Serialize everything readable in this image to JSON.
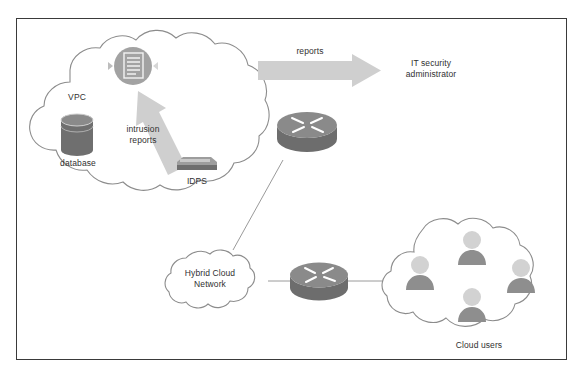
{
  "figure": {
    "caption": "",
    "frame_color": "#3a3a3a",
    "background": "#ffffff"
  },
  "palette": {
    "cloud_outline": "#8c8c8c",
    "device_gray": "#7f7f7f",
    "device_gray_dark": "#6b6b6b",
    "arrow_gray": "#c3c3c3",
    "line_gray": "#9a9a9a",
    "user_body": "#8e8e8e",
    "user_head": "#d2d2d2",
    "text": "#303030"
  },
  "labels": {
    "vpc": "VPC",
    "database": "database",
    "intrusion_reports": "intrusion\nreports",
    "idps": "IDPS",
    "reports": "reports",
    "it_security_admin": "IT security\nadministrator",
    "hybrid_cloud_network": "Hybrid Cloud\nNetwork",
    "cloud_users": "Cloud users"
  },
  "nodes": [
    {
      "id": "vpc-cloud",
      "type": "cloud",
      "label": "VPC"
    },
    {
      "id": "database",
      "type": "cylinder",
      "label": "database"
    },
    {
      "id": "report-badge",
      "type": "document-circle",
      "label": ""
    },
    {
      "id": "idps",
      "type": "appliance",
      "label": "IDPS"
    },
    {
      "id": "router-top",
      "type": "router",
      "label": ""
    },
    {
      "id": "router-bottom",
      "type": "router",
      "label": ""
    },
    {
      "id": "hybrid-cloud",
      "type": "cloud",
      "label": "Hybrid Cloud Network"
    },
    {
      "id": "users-cloud",
      "type": "cloud",
      "label": "Cloud users"
    },
    {
      "id": "user-1",
      "type": "user",
      "label": ""
    },
    {
      "id": "user-2",
      "type": "user",
      "label": ""
    },
    {
      "id": "user-3",
      "type": "user",
      "label": ""
    },
    {
      "id": "user-4",
      "type": "user",
      "label": ""
    }
  ],
  "edges": [
    {
      "id": "idps-to-report",
      "from": "idps",
      "to": "report-badge",
      "style": "block-arrow",
      "label": "intrusion\nreports"
    },
    {
      "id": "vpc-to-admin",
      "from": "router-top",
      "to": "it-security-admin",
      "style": "block-arrow",
      "label": "reports"
    },
    {
      "id": "routertop-to-hybrid",
      "from": "router-top",
      "to": "hybrid-cloud",
      "style": "line",
      "label": ""
    },
    {
      "id": "hybrid-to-routerbottom",
      "from": "hybrid-cloud",
      "to": "router-bottom",
      "style": "line",
      "label": ""
    },
    {
      "id": "routerbottom-to-users",
      "from": "router-bottom",
      "to": "users-cloud",
      "style": "line",
      "label": ""
    }
  ]
}
